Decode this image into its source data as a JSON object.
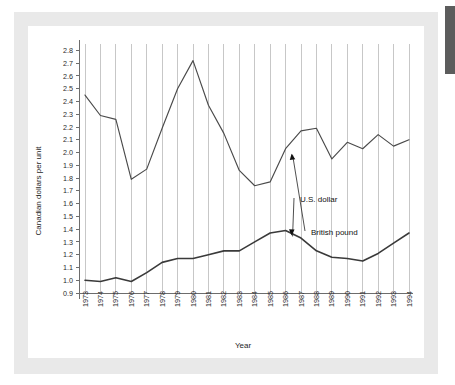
{
  "chart_data": {
    "type": "line",
    "title": "",
    "xlabel": "Year",
    "ylabel": "Canadian dollars per unit",
    "x": [
      1973,
      1974,
      1975,
      1976,
      1977,
      1978,
      1979,
      1980,
      1981,
      1982,
      1983,
      1984,
      1985,
      1986,
      1987,
      1988,
      1989,
      1990,
      1991,
      1992,
      1993,
      1994
    ],
    "categories": [
      "1973",
      "1974",
      "1975",
      "1976",
      "1977",
      "1978",
      "1979",
      "1980",
      "1981",
      "1982",
      "1983",
      "1984",
      "1985",
      "1986",
      "1987",
      "1988",
      "1989",
      "1990",
      "1991",
      "1992",
      "1993",
      "1994"
    ],
    "series": [
      {
        "name": "British pound",
        "values": [
          2.45,
          2.29,
          2.26,
          1.79,
          1.87,
          2.19,
          2.5,
          2.72,
          2.37,
          2.15,
          1.86,
          1.74,
          1.77,
          2.03,
          2.17,
          2.19,
          1.95,
          2.08,
          2.03,
          2.14,
          2.05,
          2.1
        ]
      },
      {
        "name": "U.S. dollar",
        "values": [
          1.0,
          0.99,
          1.02,
          0.99,
          1.06,
          1.14,
          1.17,
          1.17,
          1.2,
          1.23,
          1.23,
          1.3,
          1.37,
          1.39,
          1.33,
          1.23,
          1.18,
          1.17,
          1.15,
          1.21,
          1.29,
          1.37
        ]
      }
    ],
    "ylim": [
      0.9,
      2.85
    ],
    "yticks": [
      "0.9",
      "1.0",
      "1.1",
      "1.2",
      "1.3",
      "1.4",
      "1.5",
      "1.6",
      "1.7",
      "1.8",
      "1.9",
      "2.0",
      "2.1",
      "2.2",
      "2.3",
      "2.4",
      "2.5",
      "2.6",
      "2.7",
      "2.8"
    ],
    "grid": "vertical",
    "legend_position": "inline-annotations",
    "annotations": [
      {
        "text": "British pound",
        "target_year": 1986,
        "target_value": 2.03
      },
      {
        "text": "U.S. dollar",
        "target_year": 1986,
        "target_value": 1.39
      }
    ],
    "line_color": "#4a4a4a",
    "grid_color": "#b9b9b9",
    "axis_color": "#6d6d6d",
    "background_color": "#ffffff"
  },
  "page": {
    "backdrop_color": "#e9e9e9",
    "card_color": "#ffffff",
    "edge_marker_color": "#5c5c5c"
  }
}
